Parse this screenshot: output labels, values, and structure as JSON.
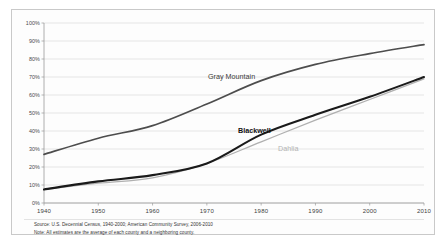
{
  "chart_data": {
    "type": "line",
    "title": "",
    "xlabel": "",
    "ylabel": "",
    "x": [
      1940,
      1950,
      1960,
      1970,
      1980,
      1990,
      2000,
      2010
    ],
    "xlim": [
      1940,
      2010
    ],
    "ylim": [
      0,
      100
    ],
    "ytick_labels": [
      "100%",
      "90%",
      "80%",
      "70%",
      "60%",
      "50%",
      "40%",
      "30%",
      "20%",
      "10%",
      "0%"
    ],
    "ytick_values": [
      100,
      90,
      80,
      70,
      60,
      50,
      40,
      30,
      20,
      10,
      0
    ],
    "xtick_labels": [
      "1940",
      "1950",
      "1960",
      "1970",
      "1980",
      "1990",
      "2000",
      "2010"
    ],
    "grid": true,
    "grid_axis": "y",
    "legend_position": "inline-annotations",
    "series": [
      {
        "name": "Gray Mountain",
        "color": "#4d4d4d",
        "width": 1.7,
        "values": [
          27,
          36,
          43,
          55,
          68,
          77,
          83,
          88
        ]
      },
      {
        "name": "Blackwell",
        "color": "#1a1a1a",
        "width": 2.1,
        "values": [
          7.5,
          12,
          15.5,
          22,
          38,
          49,
          59,
          70
        ]
      },
      {
        "name": "Dahlia",
        "color": "#b0b0b0",
        "width": 1.3,
        "values": [
          7.5,
          11,
          14,
          22,
          34,
          46,
          57.5,
          69
        ]
      }
    ],
    "annotations": [
      {
        "text": "Gray Mountain",
        "series": "Gray Mountain"
      },
      {
        "text": "Blackwell",
        "series": "Blackwell"
      },
      {
        "text": "Dahlia",
        "series": "Dahlia"
      }
    ]
  },
  "footnotes": {
    "source": "Source: U.S. Decennial Census, 1940-2000; American Community Survey, 2006-2010",
    "note": "Note: All estimates are the average of each county and a neighboring county."
  }
}
